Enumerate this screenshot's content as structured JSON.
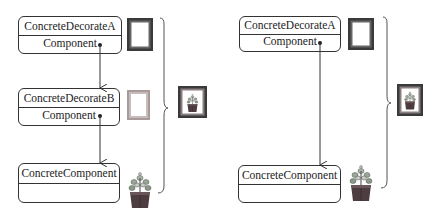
{
  "left_diagram": {
    "boxes": [
      {
        "name": "ConcreteDecorateA",
        "attribute": "Component"
      },
      {
        "name": "ConcreteDecorateB",
        "attribute": "Component"
      },
      {
        "name": "ConcreteComponent",
        "attribute": ""
      }
    ],
    "decorations": [
      "dark-frame-icon",
      "light-frame-icon",
      "plant-icon"
    ],
    "result": "framed-plant-picture-icon"
  },
  "right_diagram": {
    "boxes": [
      {
        "name": "ConcreteDecorateA",
        "attribute": "Component"
      },
      {
        "name": "ConcreteComponent",
        "attribute": ""
      }
    ],
    "decorations": [
      "dark-frame-icon",
      "plant-icon"
    ],
    "result": "framed-plant-picture-icon"
  },
  "colors": {
    "line": "#333333",
    "dark_frame": "#3a3a3a",
    "light_frame": "#a89a9a",
    "pot": "#4a3b3b",
    "leaves": "#8a9a88"
  }
}
